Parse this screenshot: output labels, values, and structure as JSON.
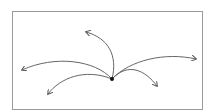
{
  "diagram": {
    "frame": {
      "x": 12,
      "y": 11,
      "width": 191,
      "height": 99,
      "stroke": "#9a9a9a"
    },
    "stroke_color": "#666666",
    "origin": {
      "x": 112,
      "y": 79,
      "color": "#111111"
    },
    "arrows": [
      {
        "id": "up",
        "path": "M112,79 C118,55 108,38 86,32"
      },
      {
        "id": "left",
        "path": "M112,79 C95,60 55,55 22,70"
      },
      {
        "id": "lower-left",
        "path": "M112,79 C85,68 60,78 48,94"
      },
      {
        "id": "right",
        "path": "M112,79 C130,60 165,52 196,59"
      },
      {
        "id": "lower-right",
        "path": "M112,79 C128,62 145,70 157,86"
      }
    ]
  }
}
